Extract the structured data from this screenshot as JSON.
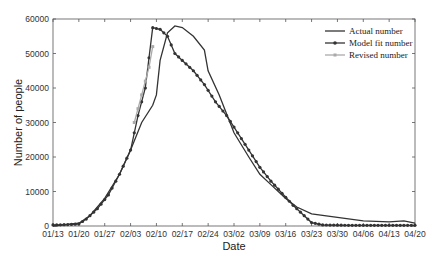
{
  "chart_data": {
    "type": "line",
    "title": "",
    "xlabel": "Date",
    "ylabel": "Number of people",
    "ylim": [
      0,
      60000
    ],
    "yticks": [
      0,
      10000,
      20000,
      30000,
      40000,
      50000,
      60000
    ],
    "xticks": [
      "01/13",
      "01/20",
      "01/27",
      "02/03",
      "02/10",
      "02/17",
      "02/24",
      "03/02",
      "03/09",
      "03/16",
      "03/23",
      "03/30",
      "04/06",
      "04/13",
      "04/20"
    ],
    "grid": false,
    "legend_position": "upper right",
    "x_unit": "days since 01/13",
    "series": [
      {
        "name": "Actual number",
        "color": "#333333",
        "marker": "none",
        "points": [
          [
            0,
            0
          ],
          [
            7,
            800
          ],
          [
            10,
            3000
          ],
          [
            14,
            8000
          ],
          [
            18,
            15000
          ],
          [
            21,
            22000
          ],
          [
            24,
            30000
          ],
          [
            27,
            35000
          ],
          [
            28,
            38000
          ],
          [
            29,
            48000
          ],
          [
            31,
            56000
          ],
          [
            33,
            58000
          ],
          [
            35,
            57500
          ],
          [
            38,
            55000
          ],
          [
            41,
            51000
          ],
          [
            42,
            45000
          ],
          [
            45,
            38000
          ],
          [
            49,
            27000
          ],
          [
            53,
            20000
          ],
          [
            56,
            15000
          ],
          [
            59,
            12000
          ],
          [
            63,
            8000
          ],
          [
            66,
            5500
          ],
          [
            70,
            3500
          ],
          [
            77,
            2500
          ],
          [
            84,
            1500
          ],
          [
            91,
            1200
          ],
          [
            95,
            1500
          ],
          [
            98,
            800
          ]
        ]
      },
      {
        "name": "Model fit number",
        "color": "#333333",
        "marker": "circle",
        "points": [
          [
            0,
            300
          ],
          [
            4,
            400
          ],
          [
            7,
            600
          ],
          [
            9,
            2000
          ],
          [
            12,
            5000
          ],
          [
            15,
            9000
          ],
          [
            18,
            15000
          ],
          [
            21,
            22000
          ],
          [
            23,
            32000
          ],
          [
            25,
            40000
          ],
          [
            27,
            57500
          ],
          [
            29,
            57000
          ],
          [
            31,
            55000
          ],
          [
            33,
            50000
          ],
          [
            35,
            48000
          ],
          [
            38,
            45000
          ],
          [
            41,
            41000
          ],
          [
            44,
            36000
          ],
          [
            47,
            32000
          ],
          [
            50,
            27000
          ],
          [
            53,
            22000
          ],
          [
            56,
            17000
          ],
          [
            59,
            13000
          ],
          [
            62,
            9500
          ],
          [
            65,
            6000
          ],
          [
            68,
            3000
          ],
          [
            70,
            1000
          ],
          [
            73,
            300
          ],
          [
            80,
            200
          ],
          [
            98,
            200
          ]
        ]
      },
      {
        "name": "Revised number",
        "color": "#aaaaaa",
        "marker": "square",
        "points": [
          [
            22,
            30000
          ],
          [
            23,
            34000
          ],
          [
            24,
            38000
          ],
          [
            25,
            42000
          ],
          [
            26,
            46000
          ],
          [
            27,
            52000
          ]
        ]
      }
    ]
  }
}
